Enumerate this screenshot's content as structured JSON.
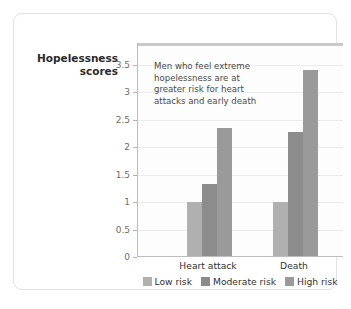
{
  "chart_data": {
    "type": "bar",
    "title": "",
    "xlabel": "",
    "ylabel": "Hopelessness scores",
    "ylabel_lines": [
      "Hopelessness",
      "scores"
    ],
    "categories": [
      "Heart attack",
      "Death"
    ],
    "series": [
      {
        "name": "Low risk",
        "color": "#b0b0b0",
        "values": [
          1.0,
          1.0
        ]
      },
      {
        "name": "Moderate risk",
        "color": "#8c8c8c",
        "values": [
          1.33,
          2.27
        ]
      },
      {
        "name": "High risk",
        "color": "#9a9a9a",
        "values": [
          2.36,
          3.4
        ]
      }
    ],
    "ylim": [
      0,
      3.9
    ],
    "yticks": [
      0,
      0.5,
      1,
      1.5,
      2,
      2.5,
      3,
      3.5
    ],
    "ytick_labels": [
      "0",
      "0.5",
      "1",
      "1.5",
      "2",
      "2.5",
      "3",
      "3.5"
    ],
    "grid": true,
    "legend_position": "bottom",
    "annotation": {
      "lines": [
        "Men who feel extreme",
        "hopelessness are at",
        "greater risk for heart",
        "attacks and early death"
      ]
    }
  },
  "colors": {
    "card_border": "#e2e2e2",
    "plot_background": "#fdfdfd",
    "gridline": "#ececec",
    "axis": "#bdbdbd",
    "tick_text": "#6e6e6e",
    "label_text": "#333333",
    "title_text": "#2b2b2b",
    "annotation_text": "#4a4a4a"
  }
}
